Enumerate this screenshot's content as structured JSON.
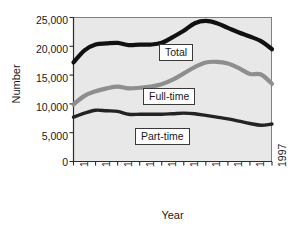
{
  "chart_data": {
    "type": "line",
    "title": "",
    "xlabel": "Year",
    "ylabel": "Number",
    "x": [
      1979,
      1980,
      1981,
      1982,
      1983,
      1984,
      1985,
      1986,
      1987,
      1988,
      1989,
      1990,
      1991,
      1992,
      1993,
      1994,
      1995,
      1996,
      1997
    ],
    "xlim": [
      1979,
      1997
    ],
    "ylim": [
      0,
      25000
    ],
    "xticks": [
      "1979",
      "1981",
      "1983",
      "1985",
      "1987",
      "1989",
      "1991",
      "1993",
      "1995",
      "1997"
    ],
    "yticks": [
      "0",
      "5,000",
      "10,000",
      "15,000",
      "20,000",
      "25,000"
    ],
    "grid": false,
    "legend_position": "inline-labels",
    "series": [
      {
        "name": "Total",
        "color": "#111111",
        "values": [
          17200,
          19300,
          20300,
          20500,
          20600,
          20200,
          20300,
          20300,
          20600,
          21600,
          22700,
          24000,
          24400,
          24000,
          23200,
          22400,
          21700,
          20900,
          19500
        ]
      },
      {
        "name": "Full-time",
        "color": "#8e8e8e",
        "values": [
          9900,
          11400,
          12200,
          12700,
          13000,
          12700,
          12800,
          13000,
          13400,
          14200,
          15300,
          16400,
          17200,
          17300,
          17000,
          16200,
          15200,
          15100,
          13500
        ]
      },
      {
        "name": "Part-time",
        "color": "#232323",
        "values": [
          7700,
          8400,
          8900,
          8800,
          8700,
          8200,
          8200,
          8200,
          8200,
          8300,
          8400,
          8300,
          8000,
          7700,
          7400,
          7000,
          6600,
          6300,
          6500
        ]
      }
    ]
  },
  "axes": {
    "ylabel": "Number",
    "xlabel": "Year"
  },
  "legend": {
    "total": "Total",
    "fulltime": "Full-time",
    "parttime": "Part-time"
  },
  "colors": {
    "plot_background": "#e8e8e8",
    "frame": "#6d6d6d",
    "axis": "#2b2b2b",
    "total_line": "#111111",
    "fulltime_line": "#8e8e8e",
    "parttime_line": "#232323"
  }
}
